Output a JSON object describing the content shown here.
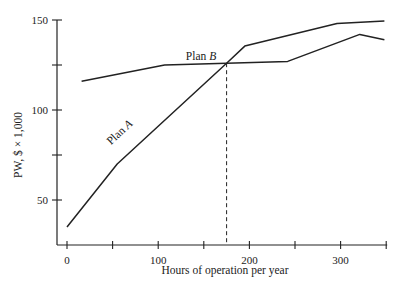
{
  "chart_data": {
    "type": "line",
    "title": "",
    "xlabel": "Hours of operation per year",
    "ylabel": "PW, $ × 1,000",
    "xlim": [
      0,
      350
    ],
    "ylim": [
      25,
      150
    ],
    "x_ticks": [
      0,
      50,
      100,
      150,
      200,
      250,
      300,
      350
    ],
    "x_tick_labels": [
      "0",
      "",
      "100",
      "",
      "200",
      "",
      "300",
      ""
    ],
    "y_ticks": [
      50,
      75,
      100,
      125,
      150
    ],
    "y_tick_labels": [
      "50",
      "",
      "100",
      "",
      "150"
    ],
    "grid": false,
    "series": [
      {
        "name": "Plan A",
        "label": "Plan A",
        "points": [
          [
            0,
            35
          ],
          [
            55,
            70
          ],
          [
            175,
            126
          ],
          [
            195,
            135.5
          ],
          [
            296,
            148
          ],
          [
            348,
            149.5
          ]
        ]
      },
      {
        "name": "Plan B",
        "label": "Plan B",
        "points": [
          [
            16,
            116
          ],
          [
            107,
            125
          ],
          [
            175,
            126
          ],
          [
            242,
            127
          ],
          [
            321,
            142
          ],
          [
            348,
            139
          ]
        ]
      }
    ],
    "annotations": [
      {
        "type": "vertical-dashed-line",
        "x": 175,
        "from_y": 25,
        "to_y": 126,
        "description": "breakeven between Plan A and Plan B"
      }
    ]
  }
}
